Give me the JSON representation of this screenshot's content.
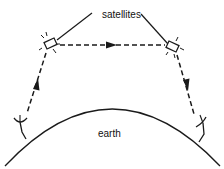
{
  "diagram": {
    "labels": {
      "satellites": "satellites",
      "earth": "earth"
    },
    "colors": {
      "stroke": "#1a1a1a",
      "background": "#ffffff"
    },
    "nodes": [
      {
        "id": "left-ground-station",
        "type": "dish-antenna"
      },
      {
        "id": "left-satellite",
        "type": "satellite"
      },
      {
        "id": "right-satellite",
        "type": "satellite"
      },
      {
        "id": "right-ground-station",
        "type": "dish-antenna"
      }
    ],
    "links": [
      {
        "from": "left-ground-station",
        "to": "left-satellite",
        "style": "dashed",
        "arrow": "up"
      },
      {
        "from": "left-satellite",
        "to": "right-satellite",
        "style": "dashed",
        "arrow": "right"
      },
      {
        "from": "right-satellite",
        "to": "right-ground-station",
        "style": "dashed",
        "arrow": "down"
      }
    ]
  }
}
